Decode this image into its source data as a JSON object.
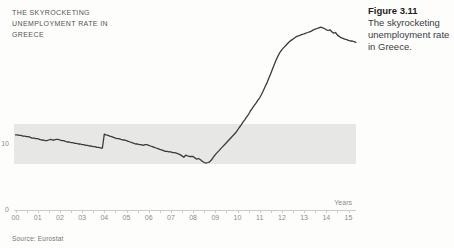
{
  "header": {
    "title_lines": [
      "THE SKYROCKETING",
      "UNEMPLOYMENT RATE IN",
      "GREECE"
    ]
  },
  "caption": {
    "figure_label": "Figure 3.11",
    "text": "The skyrocketing unemployment rate in Greece."
  },
  "source": "Source: Eurostat",
  "chart_data": {
    "type": "line",
    "title": "The skyrocketing unemployment rate in Greece",
    "xlabel": "Years",
    "ylabel": "",
    "x_ticks": [
      "00",
      "01",
      "02",
      "03",
      "04",
      "05",
      "06",
      "07",
      "08",
      "09",
      "10",
      "11",
      "12",
      "13",
      "14",
      "15"
    ],
    "y_ticks": [
      0,
      10
    ],
    "xlim": [
      0,
      15.4
    ],
    "ylim": [
      0,
      30
    ],
    "grid": false,
    "legend": "none",
    "highlight_band": {
      "from": 7,
      "to": 13,
      "color": "#e7e7e6"
    },
    "colors": {
      "line": "#3a3a3a",
      "axis": "#cbcbcb",
      "tick_labels": "#8c8c8c"
    },
    "x_start": 0,
    "x_step": 0.083333,
    "series": [
      {
        "name": "Unemployment rate in Greece (%, monthly, 2000-2015)",
        "values": [
          11.4,
          11.4,
          11.3,
          11.3,
          11.2,
          11.2,
          11.1,
          11.1,
          11.0,
          10.9,
          10.9,
          10.8,
          10.8,
          10.7,
          10.6,
          10.6,
          10.5,
          10.5,
          10.6,
          10.7,
          10.6,
          10.6,
          10.7,
          10.7,
          10.6,
          10.5,
          10.5,
          10.4,
          10.3,
          10.3,
          10.2,
          10.2,
          10.1,
          10.1,
          10.0,
          10.0,
          9.9,
          9.9,
          9.8,
          9.8,
          9.7,
          9.7,
          9.6,
          9.6,
          9.5,
          9.5,
          9.4,
          9.4,
          11.5,
          11.4,
          11.3,
          11.2,
          11.1,
          11.0,
          10.9,
          10.8,
          10.8,
          10.7,
          10.6,
          10.6,
          10.5,
          10.4,
          10.3,
          10.2,
          10.1,
          10.0,
          10.0,
          9.9,
          9.9,
          9.8,
          9.9,
          9.9,
          9.8,
          9.7,
          9.6,
          9.5,
          9.4,
          9.3,
          9.2,
          9.1,
          9.0,
          8.9,
          8.9,
          8.8,
          8.8,
          8.7,
          8.7,
          8.6,
          8.5,
          8.4,
          8.2,
          8.0,
          8.3,
          8.2,
          8.1,
          8.1,
          8.1,
          7.9,
          7.7,
          7.8,
          7.6,
          7.4,
          7.2,
          7.1,
          7.2,
          7.3,
          7.6,
          8.0,
          8.4,
          8.7,
          9.0,
          9.3,
          9.6,
          9.9,
          10.2,
          10.5,
          10.8,
          11.1,
          11.4,
          11.7,
          12.1,
          12.5,
          12.9,
          13.3,
          13.7,
          14.1,
          14.5,
          15.0,
          15.4,
          15.8,
          16.2,
          16.6,
          17.0,
          17.5,
          18.1,
          18.7,
          19.3,
          20.0,
          20.7,
          21.4,
          22.1,
          22.8,
          23.4,
          23.9,
          24.3,
          24.6,
          24.9,
          25.2,
          25.5,
          25.7,
          25.9,
          26.1,
          26.3,
          26.4,
          26.5,
          26.6,
          26.7,
          26.8,
          26.9,
          27.0,
          27.1,
          27.3,
          27.4,
          27.5,
          27.6,
          27.7,
          27.6,
          27.5,
          27.3,
          27.2,
          27.3,
          27.0,
          26.8,
          26.9,
          26.5,
          26.3,
          26.1,
          26.0,
          25.9,
          25.8,
          25.7,
          25.6,
          25.6,
          25.5,
          25.4
        ]
      }
    ]
  }
}
